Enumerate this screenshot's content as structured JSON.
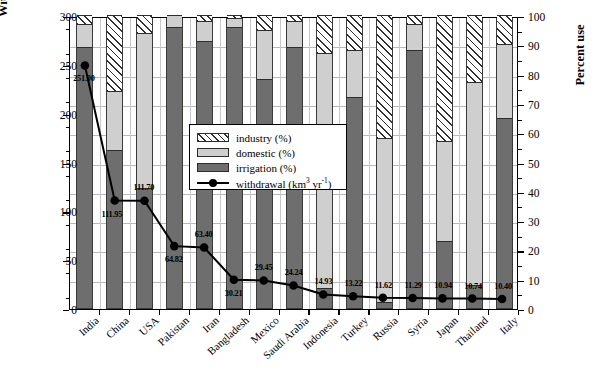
{
  "chart_data": {
    "type": "bar",
    "title": "",
    "xlabel": "",
    "ylabel": "Withdrawal rate (km3 yr-1)",
    "y2label": "Percent use",
    "ylim": [
      0,
      300
    ],
    "y2lim": [
      0,
      100
    ],
    "yticks": [
      0,
      50,
      100,
      150,
      200,
      250,
      300
    ],
    "y2ticks": [
      0,
      10,
      20,
      30,
      40,
      50,
      60,
      70,
      80,
      90,
      100
    ],
    "grid": true,
    "legend_position": "center-left",
    "categories": [
      "India",
      "China",
      "USA",
      "Pakistan",
      "Iran",
      "Bangladesh",
      "Mexico",
      "Saudi Arabia",
      "Indonesia",
      "Turkey",
      "Russia",
      "Syria",
      "Japan",
      "Thailand",
      "Italy"
    ],
    "series": [
      {
        "name": "irrigation (%)",
        "values": [
          89,
          54,
          41,
          96,
          91,
          96,
          78,
          89,
          7,
          72,
          2,
          88,
          23,
          8,
          65
        ]
      },
      {
        "name": "domestic (%)",
        "values": [
          8,
          20,
          53,
          4,
          7,
          3,
          17,
          9,
          80,
          16,
          56,
          9,
          34,
          69,
          25
        ]
      },
      {
        "name": "industry (%)",
        "values": [
          3,
          26,
          6,
          0,
          2,
          1,
          5,
          2,
          13,
          12,
          42,
          3,
          43,
          23,
          10
        ]
      },
      {
        "name": "withdrawal (km3 yr-1)",
        "values": [
          251.0,
          111.95,
          111.7,
          64.82,
          63.4,
          30.21,
          29.45,
          24.24,
          14.93,
          13.22,
          11.62,
          11.29,
          10.94,
          10.74,
          10.4
        ]
      }
    ],
    "point_labels": [
      "251.00",
      "111.95",
      "111.70",
      "64.82",
      "63.40",
      "30.21",
      "29.45",
      "24.24",
      "14.93",
      "13.22",
      "11.62",
      "11.29",
      "10.94",
      "10.74",
      "10.40"
    ]
  },
  "legend": {
    "items": [
      {
        "label": "industry (%)",
        "swatch": "hatch"
      },
      {
        "label": "domestic (%)",
        "swatch": "light-gray"
      },
      {
        "label": "irrigation (%)",
        "swatch": "dark-gray"
      },
      {
        "label": "withdrawal (km3 yr-1)",
        "swatch": "line-marker"
      }
    ]
  },
  "axis": {
    "left_title_main": "Withdrawal rate (km",
    "left_title_sup1": "3",
    "left_title_mid": " yr",
    "left_title_sup2": "-1",
    "left_title_end": ")",
    "right_title": "Percent use"
  },
  "colors": {
    "irrigation": "#6e6e6e",
    "domestic": "#cfcfcf",
    "industry_hatch": "#2f2f2f",
    "line": "#000000",
    "grid": "#b9b9c6",
    "frame": "#000000",
    "background": "#ffffff"
  }
}
